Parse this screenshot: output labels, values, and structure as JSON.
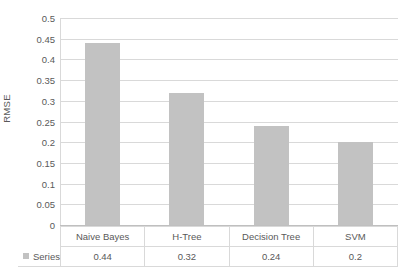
{
  "chart_data": {
    "type": "bar",
    "title": "",
    "subtitle": "",
    "xlabel": "",
    "ylabel": "RMSE",
    "categories": [
      "Naive Bayes",
      "H-Tree",
      "Decision Tree",
      "SVM"
    ],
    "series": [
      {
        "name": "Series1",
        "values": [
          0.44,
          0.32,
          0.24,
          0.2
        ],
        "color": "#c2c2c2"
      }
    ],
    "values": [
      0.44,
      0.32,
      0.24,
      0.2
    ],
    "value_labels": [
      "0.44",
      "0.32",
      "0.24",
      "0.2"
    ],
    "ylim": [
      0,
      0.5
    ],
    "ytick_values": [
      0,
      0.05,
      0.1,
      0.15,
      0.2,
      0.25,
      0.3,
      0.35,
      0.4,
      0.45,
      0.5
    ],
    "ytick_labels": [
      "0",
      "0.05",
      "0.1",
      "0.15",
      "0.2",
      "0.25",
      "0.3",
      "0.35",
      "0.4",
      "0.45",
      "0.5"
    ],
    "grid": true,
    "grid_axis": "y",
    "legend_position": "data-table",
    "data_table_visible": true,
    "colors": {
      "bar": "#c2c2c2",
      "gridline": "#d9d9d9",
      "text": "#595959",
      "background": "#ffffff",
      "table_border": "#d9d9d9"
    }
  },
  "axis": {
    "y_title": "RMSE"
  },
  "legend": {
    "series_name": "Series1",
    "swatch_color": "#c2c2c2"
  },
  "table": {
    "category_row": [
      "Naive Bayes",
      "H-Tree",
      "Decision Tree",
      "SVM"
    ],
    "value_row": [
      "0.44",
      "0.32",
      "0.24",
      "0.2"
    ]
  }
}
